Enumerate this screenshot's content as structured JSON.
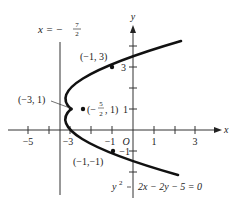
{
  "diagram": {
    "type": "parabola-graph",
    "equation": "y² − 2x − 2y − 5 = 0",
    "equation_parts": {
      "lhs_var": "y",
      "lhs_exp": "2",
      "rest": "2x − 2y − 5 = 0"
    },
    "axes": {
      "x_label": "x",
      "y_label": "y",
      "origin_label": "O",
      "x_ticks": [
        -5,
        -4,
        -3,
        -2,
        -1,
        1,
        2,
        3
      ],
      "x_tick_labels": [
        {
          "value": -5,
          "text": "−5"
        },
        {
          "value": -3,
          "text": "−3"
        },
        {
          "value": -1,
          "text": "−1"
        },
        {
          "value": 1,
          "text": "1"
        },
        {
          "value": 3,
          "text": "3"
        }
      ],
      "y_ticks": [
        -2,
        -1,
        1,
        2,
        3,
        4
      ],
      "y_tick_labels": [
        {
          "value": 3,
          "text": "3"
        },
        {
          "value": 1,
          "text": "1"
        },
        {
          "value": -1,
          "text": "−1"
        }
      ]
    },
    "directrix": {
      "label_prefix": "x = −",
      "label_num": "7",
      "label_den": "2",
      "x": -3.5
    },
    "points": [
      {
        "name": "point-top",
        "label": "(−1, 3)",
        "x": -1,
        "y": 3
      },
      {
        "name": "point-vertex",
        "label": "(−3, 1)",
        "x": -3,
        "y": 1
      },
      {
        "name": "point-focus",
        "label_prefix": "(−",
        "label_num": "5",
        "label_den": "2",
        "label_suffix": ", 1)",
        "x": -2.5,
        "y": 1
      },
      {
        "name": "point-bottom",
        "label": "(−1,−1)",
        "x": -1,
        "y": -1
      }
    ],
    "colors": {
      "ink": "#222222",
      "curve": "#111111",
      "background": "#ffffff"
    }
  }
}
